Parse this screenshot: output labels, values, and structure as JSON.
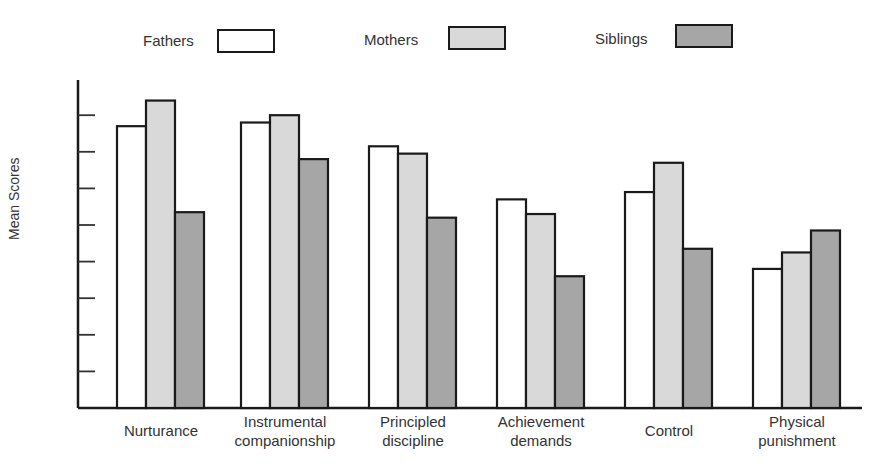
{
  "chart_data": {
    "type": "bar",
    "title": "",
    "xlabel": "",
    "ylabel": "Mean Scores",
    "ylim": [
      0,
      9
    ],
    "y_ticks_unlabeled": 8,
    "grid": false,
    "legend_position": "top",
    "categories": [
      "Nurturance",
      "Instrumental companionship",
      "Principled discipline",
      "Achievement demands",
      "Control",
      "Physical punishment"
    ],
    "category_lines": [
      [
        "Nurturance"
      ],
      [
        "Instrumental",
        "companionship"
      ],
      [
        "Principled",
        "discipline"
      ],
      [
        "Achievement",
        "demands"
      ],
      [
        "Control"
      ],
      [
        "Physical",
        "punishment"
      ]
    ],
    "series": [
      {
        "name": "Fathers",
        "color": "#ffffff",
        "values": [
          7.7,
          7.8,
          7.15,
          5.7,
          5.9,
          3.8
        ]
      },
      {
        "name": "Mothers",
        "color": "#d9d9d9",
        "values": [
          8.4,
          8.0,
          6.95,
          5.3,
          6.7,
          4.25
        ]
      },
      {
        "name": "Siblings",
        "color": "#a6a6a6",
        "values": [
          5.35,
          6.8,
          5.2,
          3.6,
          4.35,
          4.85
        ]
      }
    ]
  },
  "legend": [
    {
      "label": "Fathers",
      "color": "#ffffff"
    },
    {
      "label": "Mothers",
      "color": "#d9d9d9"
    },
    {
      "label": "Siblings",
      "color": "#a6a6a6"
    }
  ],
  "axis": {
    "ylabel": "Mean Scores"
  }
}
